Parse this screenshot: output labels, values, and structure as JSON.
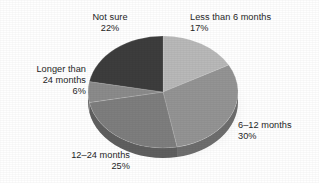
{
  "figure": {
    "background_color": "#ffffff",
    "width": 319,
    "height": 183
  },
  "labels": {
    "less_than_6": {
      "name": "Less than 6 months",
      "value": "17%"
    },
    "six_to_12": {
      "name": "6–12 months",
      "value": "30%"
    },
    "twelve_to_24": {
      "name": "12–24 months",
      "value": "25%"
    },
    "longer_24_l1": {
      "name": "Longer than",
      "name2": "24 months",
      "value": "6%"
    },
    "not_sure": {
      "name": "Not sure",
      "value": "22%"
    }
  },
  "chart_data": {
    "type": "pie",
    "title": "",
    "subtitle": "",
    "xlabel": "",
    "ylabel": "",
    "grid": false,
    "legend_position": "none",
    "style": "3d-exploded-none-grayscale",
    "start_angle_deg": 0,
    "direction": "clockwise",
    "center": {
      "x": 163,
      "y": 92
    },
    "radius": {
      "x": 75,
      "y": 56
    },
    "depth_px": 10,
    "total": 100,
    "units": "percent",
    "categories": [
      "Less than 6 months",
      "6–12 months",
      "12–24 months",
      "Longer than 24 months",
      "Not sure"
    ],
    "values": [
      17,
      30,
      25,
      6,
      22
    ],
    "data_labels": [
      "17%",
      "30%",
      "25%",
      "6%",
      "22%"
    ],
    "colors": [
      "#b9b9b9",
      "#949494",
      "#7e7e7e",
      "#8b8b8b",
      "#3d3d3d"
    ],
    "side_colors": [
      "#8e8e8e",
      "#6e6e6e",
      "#5f5f5f",
      "#686868",
      "#2c2c2c"
    ],
    "slices": [
      {
        "label": "Less than 6 months",
        "value": 17,
        "data_label": "17%",
        "color": "#b9b9b9",
        "start_deg": 0,
        "end_deg": 61.2
      },
      {
        "label": "6–12 months",
        "value": 30,
        "data_label": "30%",
        "color": "#949494",
        "start_deg": 61.2,
        "end_deg": 169.2
      },
      {
        "label": "12–24 months",
        "value": 25,
        "data_label": "25%",
        "color": "#7e7e7e",
        "start_deg": 169.2,
        "end_deg": 259.2
      },
      {
        "label": "Longer than 24 months",
        "value": 6,
        "data_label": "6%",
        "color": "#8b8b8b",
        "start_deg": 259.2,
        "end_deg": 280.8
      },
      {
        "label": "Not sure",
        "value": 22,
        "data_label": "22%",
        "color": "#3d3d3d",
        "start_deg": 280.8,
        "end_deg": 360
      }
    ]
  }
}
